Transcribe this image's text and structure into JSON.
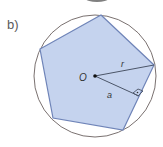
{
  "figure": {
    "part_label": "b)",
    "center_label": "O",
    "radius_label": "r",
    "apothem_label": "a",
    "shape": "regular pentagon inscribed in circle",
    "colors": {
      "pentagon_fill": "#c5d3ee",
      "pentagon_stroke": "#6f84b8",
      "circle_stroke": "#7a7170",
      "line_stroke": "#4b5568"
    }
  }
}
